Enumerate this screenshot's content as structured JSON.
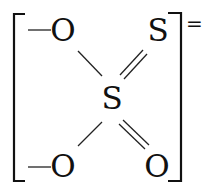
{
  "diagram": {
    "type": "chemical-structure",
    "name": "thiosulfate ion",
    "charge": "=",
    "central_atom": {
      "label": "S"
    },
    "atoms": [
      {
        "id": "o_top_left",
        "label": "O",
        "bond": "single",
        "prefix_dash": "—"
      },
      {
        "id": "s_top_right",
        "label": "S",
        "bond": "double"
      },
      {
        "id": "o_bottom_left",
        "label": "O",
        "bond": "single",
        "prefix_dash": "—"
      },
      {
        "id": "o_bottom_right",
        "label": "O",
        "bond": "double"
      }
    ],
    "bracketed": true
  }
}
